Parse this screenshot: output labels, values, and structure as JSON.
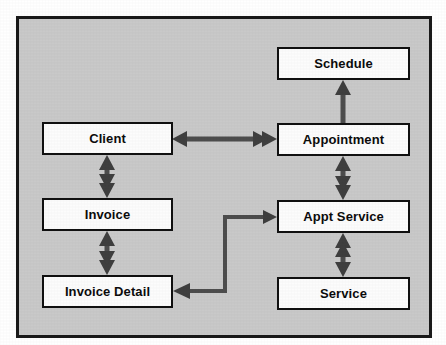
{
  "diagram": {
    "type": "entity-relationship-diagram",
    "background_color": "#c9c9c9",
    "frame_border_color": "#1a1a1a",
    "box_fill_color": "#fcfcfc",
    "box_border_color": "#111111",
    "connector_color": "#4d4d4d",
    "entities": [
      {
        "id": "schedule",
        "label": "Schedule",
        "x": 277,
        "y": 47,
        "w": 133,
        "h": 33
      },
      {
        "id": "client",
        "label": "Client",
        "x": 42,
        "y": 122,
        "w": 131,
        "h": 33
      },
      {
        "id": "appointment",
        "label": "Appointment",
        "x": 277,
        "y": 123,
        "w": 133,
        "h": 33
      },
      {
        "id": "invoice",
        "label": "Invoice",
        "x": 42,
        "y": 198,
        "w": 131,
        "h": 33
      },
      {
        "id": "appt-service",
        "label": "Appt Service",
        "x": 277,
        "y": 200,
        "w": 133,
        "h": 33
      },
      {
        "id": "invoice-detail",
        "label": "Invoice Detail",
        "x": 42,
        "y": 275,
        "w": 131,
        "h": 33
      },
      {
        "id": "service",
        "label": "Service",
        "x": 277,
        "y": 277,
        "w": 133,
        "h": 33
      }
    ],
    "relationships": [
      {
        "id": "client-appointment",
        "from": "client",
        "to": "appointment",
        "orientation": "horizontal",
        "from_arrow": "single",
        "to_arrow": "double",
        "cardinality": "one-to-many"
      },
      {
        "id": "appointment-schedule",
        "from": "appointment",
        "to": "schedule",
        "orientation": "vertical",
        "from_arrow": "none",
        "to_arrow": "single",
        "cardinality": "one-to-one"
      },
      {
        "id": "client-invoice",
        "from": "client",
        "to": "invoice",
        "orientation": "vertical",
        "from_arrow": "single",
        "to_arrow": "double",
        "cardinality": "one-to-many"
      },
      {
        "id": "invoice-invoice-detail",
        "from": "invoice",
        "to": "invoice-detail",
        "orientation": "vertical",
        "from_arrow": "single",
        "to_arrow": "double",
        "cardinality": "one-to-many"
      },
      {
        "id": "appointment-appt-service",
        "from": "appointment",
        "to": "appt-service",
        "orientation": "vertical",
        "from_arrow": "single",
        "to_arrow": "double",
        "cardinality": "one-to-many"
      },
      {
        "id": "service-appt-service",
        "from": "service",
        "to": "appt-service",
        "orientation": "vertical",
        "from_arrow": "single",
        "to_arrow": "double",
        "cardinality": "one-to-many"
      },
      {
        "id": "appt-service-invoice-detail",
        "from": "appt-service",
        "to": "invoice-detail",
        "orientation": "elbow",
        "from_arrow": "single",
        "to_arrow": "single",
        "cardinality": "one-to-one"
      }
    ]
  }
}
